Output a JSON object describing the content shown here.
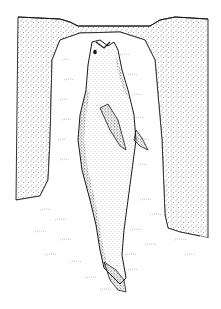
{
  "figure": {
    "style": "stippled pen illustration",
    "colors": {
      "background": "#ffffff",
      "ink": "#1a1a1a",
      "stipple": "#3a3a3a"
    }
  }
}
